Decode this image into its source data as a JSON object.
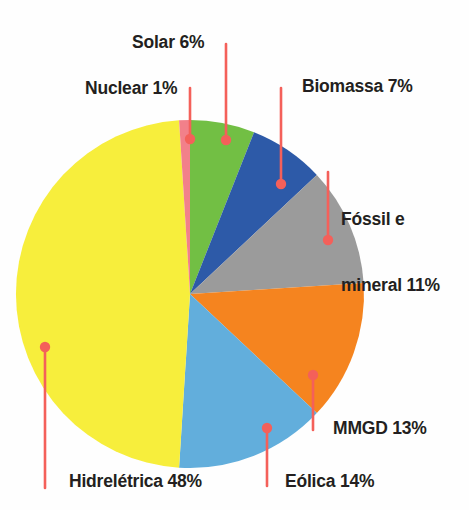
{
  "chart_data": {
    "type": "pie",
    "title": "",
    "subtitle": "",
    "xlabel": "",
    "ylabel": "",
    "legend_position": "callout-labels",
    "grid": false,
    "units": "percent",
    "total": 100,
    "categories": [
      "Solar",
      "Biomassa",
      "Fóssil e mineral",
      "MMGD",
      "Eólica",
      "Hidrelétrica",
      "Nuclear"
    ],
    "values": [
      6,
      7,
      11,
      13,
      14,
      48,
      1
    ],
    "labels": [
      "Solar 6%",
      "Biomassa 7%",
      "Fóssil e mineral 11%",
      "MMGD 13%",
      "Eólica 14%",
      "Hidrelétrica 48%",
      "Nuclear 1%"
    ],
    "colors": [
      "#72BF44",
      "#2D5AA8",
      "#9B9B9B",
      "#F5841F",
      "#62AEDC",
      "#F7EE3C",
      "#F2808A"
    ],
    "start_angle_deg": 0,
    "direction": "clockwise",
    "slices": [
      {
        "name": "Solar",
        "value": 6,
        "label": "Solar 6%",
        "color": "#72BF44"
      },
      {
        "name": "Biomassa",
        "value": 7,
        "label": "Biomassa 7%",
        "color": "#2D5AA8"
      },
      {
        "name": "Fóssil e mineral",
        "value": 11,
        "label": "Fóssil e mineral 11%",
        "color": "#9B9B9B"
      },
      {
        "name": "MMGD",
        "value": 13,
        "label": "MMGD 13%",
        "color": "#F5841F"
      },
      {
        "name": "Eólica",
        "value": 14,
        "label": "Eólica 14%",
        "color": "#62AEDC"
      },
      {
        "name": "Hidrelétrica",
        "value": 48,
        "label": "Hidrelétrica 48%",
        "color": "#F7EE3C"
      },
      {
        "name": "Nuclear",
        "value": 1,
        "label": "Nuclear 1%",
        "color": "#F2808A"
      }
    ]
  },
  "labels": {
    "solar": "Solar 6%",
    "nuclear": "Nuclear 1%",
    "biomassa": "Biomassa 7%",
    "fossil_line1": "Fóssil e",
    "fossil_line2": "mineral 11%",
    "mmgd": "MMGD 13%",
    "eolica": "Eólica 14%",
    "hidreletrica": "Hidrelétrica 48%"
  },
  "style": {
    "leader_color": "#F4605A",
    "text_color": "#231f20",
    "background": "#fefefe"
  }
}
